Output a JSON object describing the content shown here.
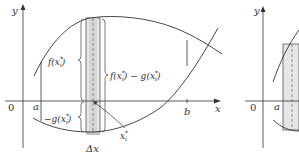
{
  "figure": {
    "left_panel": {
      "axis_labels": {
        "x": "x",
        "y": "y",
        "origin": "0"
      },
      "tick_labels": {
        "a": "a",
        "b": "b"
      },
      "annotations": {
        "f_label": "f(x",
        "f_label_sup": "*",
        "f_label_sub": "i",
        "f_label_end": ")",
        "diff_label_f": "f(x",
        "diff_label_mid": ") − g(x",
        "diff_label_end": ")",
        "neg_g_label": "−g(x",
        "neg_g_end": ")",
        "xi_label": "x",
        "xi_sup": "*",
        "xi_sub": "i",
        "delta_x": "Δx"
      }
    },
    "right_panel": {
      "axis_labels": {
        "y": "y",
        "origin": "0"
      },
      "tick_labels": {
        "a": "a"
      }
    },
    "colors": {
      "line": "#333333",
      "rect_fill": "#e8e8e8",
      "rect_inner_fill": "#d8d8d8"
    }
  }
}
